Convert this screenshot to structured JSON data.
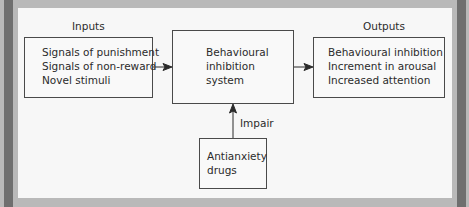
{
  "diagram": {
    "inputs": {
      "title": "Inputs",
      "lines": [
        "Signals of punishment",
        "Signals of non-reward",
        "Novel stimuli"
      ]
    },
    "system": {
      "lines": [
        "Behavioural",
        "inhibition",
        "system"
      ]
    },
    "outputs": {
      "title": "Outputs",
      "lines": [
        "Behavioural inhibition",
        "Increment in arousal",
        "Increased attention"
      ]
    },
    "modifier": {
      "lines": [
        "Antianxiety",
        "drugs"
      ],
      "edge_label": "Impair"
    },
    "edges": [
      {
        "from": "inputs",
        "to": "system"
      },
      {
        "from": "system",
        "to": "outputs"
      },
      {
        "from": "modifier",
        "to": "system",
        "label": "Impair"
      }
    ],
    "colors": {
      "frame_dark": "#6f6f6f",
      "frame_light": "#b9b9b9",
      "panel": "#f7f7f7",
      "stroke": "#4a4a4a"
    }
  }
}
